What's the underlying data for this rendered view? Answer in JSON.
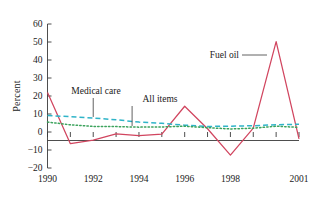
{
  "chart_data": {
    "type": "line",
    "title": "",
    "subtitle": "",
    "xlabel": "",
    "ylabel": "Percent",
    "xlim": [
      1990,
      2001
    ],
    "ylim": [
      -20,
      60
    ],
    "grid": false,
    "legend_position": "inline-annotations",
    "x": [
      1990,
      1991,
      1992,
      1993,
      1994,
      1995,
      1996,
      1997,
      1998,
      1999,
      2000,
      2001
    ],
    "xtick_labels": [
      "1990",
      "1992",
      "1994",
      "1996",
      "1998",
      "2001"
    ],
    "xtick_values": [
      1990,
      1992,
      1994,
      1996,
      1998,
      2001
    ],
    "ytick_labels": [
      "60",
      "50",
      "40",
      "30",
      "20",
      "10",
      "0",
      "-10",
      "-20"
    ],
    "ytick_values": [
      60,
      50,
      40,
      30,
      20,
      10,
      0,
      -10,
      -20
    ],
    "series": [
      {
        "name": "Fuel oil",
        "color": "#d1455f",
        "style": "solid",
        "values": [
          22,
          -6.5,
          -4.5,
          -1,
          -2,
          -1.2,
          14.3,
          1.8,
          -12.8,
          2.2,
          50.2,
          -3.8
        ]
      },
      {
        "name": "Medical care",
        "color": "#2fb4c8",
        "style": "dashed",
        "values": [
          9.2,
          8.5,
          7.8,
          6.8,
          5.5,
          4.8,
          3.8,
          3.1,
          3.2,
          3.5,
          4.0,
          4.3
        ]
      },
      {
        "name": "All items",
        "color": "#3da35d",
        "style": "dotted",
        "values": [
          5.5,
          4.0,
          3.1,
          3.0,
          2.7,
          2.8,
          3.2,
          2.4,
          1.7,
          2.1,
          3.2,
          2.6
        ]
      }
    ],
    "annotations": [
      {
        "label": "Medical care",
        "target_series": "Medical care",
        "target_x": 1992
      },
      {
        "label": "All items",
        "target_series": "All items",
        "target_x": 1993.7
      },
      {
        "label": "Fuel oil",
        "target_series": "Fuel oil",
        "target_x": 1999.6
      }
    ]
  }
}
